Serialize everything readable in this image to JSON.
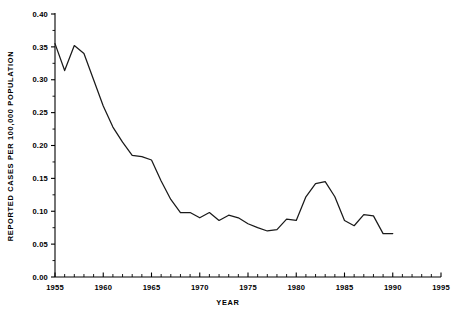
{
  "chart_data": {
    "type": "line",
    "title": "",
    "xlabel": "YEAR",
    "ylabel": "REPORTED CASES PER 100,000 POPULATION",
    "xlim": [
      1955,
      1995
    ],
    "ylim": [
      0.0,
      0.4
    ],
    "grid": false,
    "legend": false,
    "x_tick_labels": [
      "1955",
      "1960",
      "1965",
      "1970",
      "1975",
      "1980",
      "1985",
      "1990",
      "1995"
    ],
    "x_tick_values": [
      1955,
      1960,
      1965,
      1970,
      1975,
      1980,
      1985,
      1990,
      1995
    ],
    "x_minor_tick_step": 1,
    "y_tick_labels": [
      "0.00",
      "0.05",
      "0.10",
      "0.15",
      "0.20",
      "0.25",
      "0.30",
      "0.35",
      "0.40"
    ],
    "y_tick_values": [
      0.0,
      0.05,
      0.1,
      0.15,
      0.2,
      0.25,
      0.3,
      0.35,
      0.4
    ],
    "series": [
      {
        "name": "reported cases per 100,000 population",
        "color": "#1a1a1a",
        "x": [
          1955,
          1956,
          1957,
          1958,
          1959,
          1960,
          1961,
          1962,
          1963,
          1964,
          1965,
          1966,
          1967,
          1968,
          1969,
          1970,
          1971,
          1972,
          1973,
          1974,
          1975,
          1976,
          1977,
          1978,
          1979,
          1980,
          1981,
          1982,
          1983,
          1984,
          1985,
          1986,
          1987,
          1988,
          1989,
          1990
        ],
        "values": [
          0.355,
          0.314,
          0.352,
          0.34,
          0.3,
          0.26,
          0.228,
          0.205,
          0.185,
          0.183,
          0.178,
          0.146,
          0.118,
          0.098,
          0.098,
          0.09,
          0.098,
          0.086,
          0.094,
          0.09,
          0.081,
          0.075,
          0.07,
          0.072,
          0.088,
          0.086,
          0.122,
          0.142,
          0.145,
          0.122,
          0.086,
          0.078,
          0.095,
          0.093,
          0.066,
          0.066
        ]
      }
    ]
  }
}
